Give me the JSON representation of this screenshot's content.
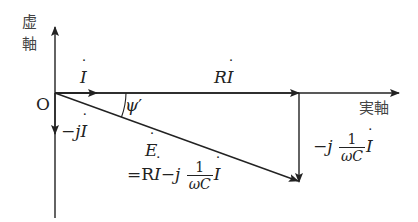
{
  "diagram": {
    "type": "phasor-diagram",
    "axes": {
      "imag_label_line1": "虚",
      "imag_label_line2": "軸",
      "real_label": "実軸",
      "origin_label": "O"
    },
    "phasors": {
      "current": {
        "name": "I",
        "label": "İ"
      },
      "resistive_drop": {
        "prefix": "R",
        "symbol": "I",
        "label": "Rİ"
      },
      "neg_j_current": {
        "prefix": "−j",
        "symbol": "I",
        "label": "−jİ"
      },
      "capacitive_drop": {
        "prefix": "−j",
        "frac_num": "1",
        "frac_den": "ωC",
        "symbol": "I",
        "label": "−j (1/ωC) İ"
      },
      "emf": {
        "symbol": "E",
        "eq_prefix": "=R",
        "eq_symbol1": "I",
        "eq_mid": "−j",
        "frac_num": "1",
        "frac_den": "ωC",
        "eq_symbol2": "I",
        "label": "Ė = Rİ − j (1/ωC) İ"
      }
    },
    "angle": {
      "label": "ψ′",
      "symbol": "ψ",
      "prime": "′"
    },
    "colors": {
      "lines": "#222222",
      "text": "#222222",
      "axis_text": "#444444",
      "background": "#ffffff"
    }
  }
}
